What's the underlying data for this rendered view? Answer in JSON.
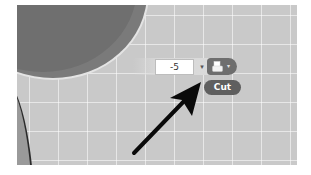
{
  "toolbar": {
    "value_input": "-5",
    "dropdown_arrow": "▾",
    "icon_button": {
      "icon": "paste-clipboard-icon",
      "caret": "▾"
    }
  },
  "tooltip": {
    "label": "Cut"
  },
  "annotation": {
    "type": "arrow",
    "color": "#000000"
  },
  "colors": {
    "canvas": "#c9c9c9",
    "grid": "#e8e8e8",
    "shape_dark": "#6f6f6f",
    "tooltip_bg": "#5f5f5f",
    "button_bg": "#6e6e6e"
  }
}
